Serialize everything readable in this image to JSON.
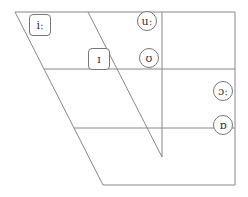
{
  "diagram": {
    "type": "vowel-trapezoid",
    "line_color": "#888888",
    "symbols": [
      {
        "id": "i-long",
        "text": "iː",
        "shape": "rounded-box",
        "x": 29,
        "y": 14,
        "w": 22,
        "h": 22
      },
      {
        "id": "i-short",
        "text": "ɪ",
        "shape": "rounded-box",
        "x": 88,
        "y": 48,
        "w": 22,
        "h": 22
      },
      {
        "id": "u-long",
        "text": "uː",
        "shape": "circle",
        "x": 137,
        "y": 11,
        "w": 20,
        "h": 20
      },
      {
        "id": "u-short",
        "text": "ʊ",
        "shape": "circle",
        "x": 139,
        "y": 48,
        "w": 20,
        "h": 20
      },
      {
        "id": "o-long",
        "text": "ɔː",
        "shape": "circle",
        "x": 213,
        "y": 81,
        "w": 20,
        "h": 20
      },
      {
        "id": "o-short",
        "text": "ɒ",
        "shape": "circle",
        "x": 213,
        "y": 115,
        "w": 20,
        "h": 20
      }
    ]
  }
}
